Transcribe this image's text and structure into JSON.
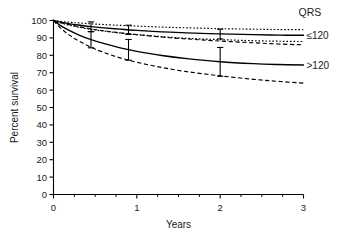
{
  "chart_data": {
    "type": "line",
    "title": "",
    "xlabel": "Years",
    "ylabel": "Percent survival",
    "xlim": [
      0,
      3
    ],
    "ylim": [
      0,
      100
    ],
    "grid": false,
    "legend_position": "right",
    "legend_title": "QRS",
    "x_ticks": [
      0,
      1,
      2,
      3
    ],
    "x_tick_labels": [
      "0",
      "1",
      "2",
      "3"
    ],
    "x_minor_ticks": [
      0.25,
      0.5,
      0.75,
      1.25,
      1.5,
      1.75,
      2.25,
      2.5,
      2.75
    ],
    "y_ticks": [
      0,
      10,
      20,
      30,
      40,
      50,
      60,
      70,
      80,
      90,
      100
    ],
    "y_tick_labels": [
      "0",
      "10",
      "20",
      "30",
      "40",
      "50",
      "60",
      "70",
      "80",
      "90",
      "100"
    ],
    "series": [
      {
        "name": "QRS ≤120 upper CI",
        "style": "dotted",
        "x": [
          0,
          0.1,
          0.2,
          0.3,
          0.45,
          0.6,
          0.8,
          1.0,
          1.3,
          1.6,
          2.0,
          2.4,
          2.7,
          3.0
        ],
        "values": [
          100,
          99.4,
          99.0,
          98.6,
          98.1,
          97.7,
          97.2,
          96.8,
          96.2,
          95.8,
          95.3,
          95.0,
          94.8,
          94.7
        ]
      },
      {
        "name": "QRS ≤120",
        "style": "solid",
        "x": [
          0,
          0.1,
          0.2,
          0.3,
          0.45,
          0.6,
          0.8,
          1.0,
          1.3,
          1.6,
          2.0,
          2.4,
          2.7,
          3.0
        ],
        "values": [
          100,
          98.9,
          98.1,
          97.4,
          96.5,
          95.8,
          95.0,
          94.3,
          93.5,
          92.9,
          92.3,
          91.9,
          91.6,
          91.5
        ]
      },
      {
        "name": "QRS ≤120 lower CI",
        "style": "dotted",
        "x": [
          0,
          0.1,
          0.2,
          0.3,
          0.45,
          0.6,
          0.8,
          1.0,
          1.3,
          1.6,
          2.0,
          2.4,
          2.7,
          3.0
        ],
        "values": [
          100,
          98.4,
          97.2,
          96.2,
          94.9,
          93.9,
          92.8,
          91.9,
          90.7,
          89.8,
          89.0,
          88.4,
          88.1,
          87.9
        ]
      },
      {
        "name": "QRS >120 upper CI",
        "style": "dashed",
        "x": [
          0,
          0.1,
          0.2,
          0.3,
          0.45,
          0.6,
          0.8,
          1.0,
          1.3,
          1.6,
          2.0,
          2.4,
          2.7,
          3.0
        ],
        "values": [
          100,
          98.6,
          97.5,
          96.5,
          95.2,
          94.1,
          92.9,
          91.9,
          90.5,
          89.4,
          88.2,
          87.2,
          86.5,
          86.0
        ]
      },
      {
        "name": "QRS >120",
        "style": "solid",
        "x": [
          0,
          0.1,
          0.2,
          0.3,
          0.45,
          0.6,
          0.8,
          1.0,
          1.3,
          1.6,
          2.0,
          2.4,
          2.7,
          3.0
        ],
        "values": [
          100,
          96.6,
          94.0,
          91.8,
          89.0,
          86.8,
          84.3,
          82.3,
          79.9,
          78.1,
          76.3,
          75.2,
          74.7,
          74.4
        ]
      },
      {
        "name": "QRS >120 lower CI",
        "style": "dashed",
        "x": [
          0,
          0.1,
          0.2,
          0.3,
          0.45,
          0.6,
          0.8,
          1.0,
          1.3,
          1.6,
          2.0,
          2.4,
          2.7,
          3.0
        ],
        "values": [
          100,
          95.0,
          91.3,
          88.3,
          84.6,
          81.7,
          78.5,
          76.0,
          73.0,
          70.6,
          68.2,
          66.2,
          65.0,
          64.0
        ]
      }
    ],
    "error_bars": [
      {
        "x": 0.45,
        "y": 96.5,
        "low": 93.6,
        "high": 99.2,
        "series": "QRS ≤120"
      },
      {
        "x": 0.45,
        "y": 89.0,
        "low": 84.3,
        "high": 93.6,
        "series": "QRS >120"
      },
      {
        "x": 0.9,
        "y": 94.7,
        "low": 92.0,
        "high": 97.3,
        "series": "QRS ≤120"
      },
      {
        "x": 0.9,
        "y": 83.2,
        "low": 77.2,
        "high": 89.1,
        "series": "QRS >120"
      },
      {
        "x": 2.0,
        "y": 92.3,
        "low": 89.4,
        "high": 95.0,
        "series": "QRS ≤120"
      },
      {
        "x": 2.0,
        "y": 76.3,
        "low": 68.0,
        "high": 84.5,
        "series": "QRS >120"
      }
    ],
    "legend_entries": [
      {
        "label": "≤120",
        "style": "solid",
        "y_value": 91.5
      },
      {
        "label": ">120",
        "style": "solid",
        "y_value": 74.4
      }
    ],
    "colors": {
      "line": "#000000",
      "axis": "#000000",
      "text": "#000000"
    }
  }
}
